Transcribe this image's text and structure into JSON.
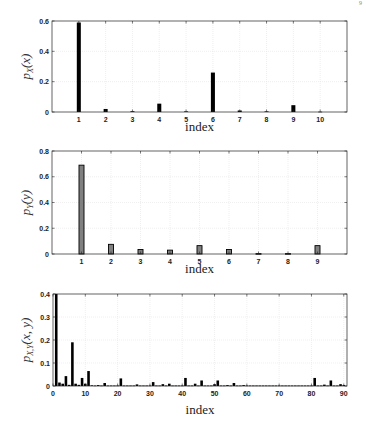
{
  "page_mark": "9",
  "chart_data": [
    {
      "type": "bar",
      "id": "px",
      "title": "",
      "xlabel": "index",
      "ylabel": "p_X(x)",
      "ylabel_main": "p",
      "ylabel_sub": "X",
      "ylabel_arg": "(x)",
      "categories": [
        1,
        2,
        3,
        4,
        5,
        6,
        7,
        8,
        9,
        10
      ],
      "values": [
        0.59,
        0.02,
        0.005,
        0.055,
        0.004,
        0.26,
        0.01,
        0.004,
        0.045,
        0.002
      ],
      "xlim": [
        0,
        11
      ],
      "ylim": [
        0,
        0.6
      ],
      "yticks": [
        0,
        0.2,
        0.4,
        0.6
      ],
      "ytick_labels": [
        "0",
        "0.2",
        "0.4",
        "0.6"
      ],
      "xticks": [
        1,
        2,
        3,
        4,
        5,
        6,
        7,
        8,
        9,
        10
      ],
      "xtick_labels": [
        "1",
        "2",
        "3",
        "4",
        "5",
        "6",
        "7",
        "8",
        "9",
        "10"
      ],
      "grid": true,
      "bar_fill": "#000000",
      "bar_edge": "#000000",
      "bar_width": 0.15
    },
    {
      "type": "bar",
      "id": "py",
      "title": "",
      "xlabel": "index",
      "ylabel": "p_Y(y)",
      "ylabel_main": "p",
      "ylabel_sub": "Y",
      "ylabel_arg": "(y)",
      "categories": [
        1,
        2,
        3,
        4,
        5,
        6,
        7,
        8,
        9
      ],
      "values": [
        0.69,
        0.075,
        0.035,
        0.03,
        0.065,
        0.035,
        0.003,
        0.003,
        0.065
      ],
      "xlim": [
        0,
        10
      ],
      "ylim": [
        0,
        0.8
      ],
      "yticks": [
        0,
        0.2,
        0.4,
        0.6,
        0.8
      ],
      "ytick_labels": [
        "0",
        "0.2",
        "0.4",
        "0.6",
        "0.8"
      ],
      "xticks": [
        1,
        2,
        3,
        4,
        5,
        6,
        7,
        8,
        9
      ],
      "xtick_labels": [
        "1",
        "2",
        "3",
        "4",
        "5",
        "6",
        "7",
        "8",
        "9"
      ],
      "grid": true,
      "bar_fill": "#808080",
      "bar_edge": "#000000",
      "bar_width": 0.17
    },
    {
      "type": "bar",
      "id": "pxy",
      "title": "",
      "xlabel": "index",
      "ylabel": "p_{X,Y}(x,y)",
      "ylabel_main": "p",
      "ylabel_sub": "X,Y",
      "ylabel_arg": "(x, y)",
      "categories": [
        1,
        2,
        3,
        4,
        5,
        6,
        7,
        8,
        9,
        10,
        11,
        12,
        13,
        14,
        15,
        16,
        17,
        18,
        19,
        20,
        21,
        22,
        23,
        24,
        25,
        26,
        27,
        28,
        29,
        30,
        31,
        32,
        33,
        34,
        35,
        36,
        37,
        38,
        39,
        40,
        41,
        42,
        43,
        44,
        45,
        46,
        47,
        48,
        49,
        50,
        51,
        52,
        53,
        54,
        55,
        56,
        57,
        58,
        59,
        60,
        61,
        62,
        63,
        64,
        65,
        66,
        67,
        68,
        69,
        70,
        71,
        72,
        73,
        74,
        75,
        76,
        77,
        78,
        79,
        80,
        81,
        82,
        83,
        84,
        85,
        86,
        87,
        88,
        89,
        90
      ],
      "values": [
        0.4,
        0.015,
        0.01,
        0.043,
        0.005,
        0.19,
        0.01,
        0.005,
        0.035,
        0.01,
        0.065,
        0.003,
        0.002,
        0.004,
        0.002,
        0.013,
        0.002,
        0.002,
        0.002,
        0.002,
        0.033,
        0.002,
        0.002,
        0.002,
        0.002,
        0.007,
        0.002,
        0.002,
        0.002,
        0.002,
        0.017,
        0.002,
        0.002,
        0.008,
        0.002,
        0.01,
        0.002,
        0.002,
        0.002,
        0.002,
        0.035,
        0.002,
        0.002,
        0.01,
        0.002,
        0.024,
        0.002,
        0.002,
        0.002,
        0.008,
        0.024,
        0.002,
        0.002,
        0.004,
        0.002,
        0.013,
        0.002,
        0.002,
        0.004,
        0.002,
        0.002,
        0.002,
        0.002,
        0.002,
        0.002,
        0.002,
        0.002,
        0.002,
        0.002,
        0.002,
        0.002,
        0.002,
        0.002,
        0.002,
        0.002,
        0.002,
        0.002,
        0.002,
        0.002,
        0.002,
        0.035,
        0.002,
        0.002,
        0.006,
        0.002,
        0.024,
        0.002,
        0.002,
        0.008,
        0.004
      ],
      "xlim": [
        0,
        91
      ],
      "ylim": [
        0,
        0.4
      ],
      "yticks": [
        0,
        0.1,
        0.2,
        0.3,
        0.4
      ],
      "ytick_labels": [
        "0",
        "0.1",
        "0.2",
        "0.3",
        "0.4"
      ],
      "xticks": [
        0,
        10,
        20,
        30,
        40,
        50,
        60,
        70,
        80,
        90
      ],
      "xtick_labels": [
        "0",
        "10",
        "20",
        "30",
        "40",
        "50",
        "60",
        "70",
        "80",
        "90"
      ],
      "grid": true,
      "bar_fill": "#000000",
      "bar_edge": "#000000",
      "bar_width": 0.8
    }
  ],
  "layout": [
    {
      "top": 21,
      "bottom": 112,
      "left": 52,
      "right": 347,
      "xlabel_y": 131,
      "ylabel_x": 18
    },
    {
      "top": 151,
      "bottom": 254,
      "left": 52,
      "right": 347,
      "xlabel_y": 273,
      "ylabel_x": 18
    },
    {
      "top": 294,
      "bottom": 386,
      "left": 53,
      "right": 347,
      "xlabel_y": 414,
      "ylabel_x": 18
    }
  ]
}
